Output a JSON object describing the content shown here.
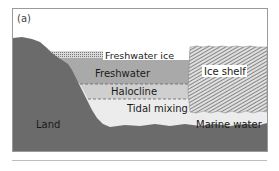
{
  "panel_label": "(a)",
  "labels": {
    "freshwater_ice": "Freshwater ice",
    "freshwater": "Freshwater",
    "halocline": "Halocline",
    "ice_shelf": "Ice shelf",
    "tidal_mixing": "Tidal mixing",
    "land": "Land",
    "marine_water": "Marine water"
  },
  "colors": {
    "land": "#6b6b6b",
    "freshwater": "#a9a9a9",
    "halocline": "#cfcfcf",
    "marine_water": "#ececec",
    "ice_hatch_dark": "#555555",
    "frame": "#9a9a9a"
  }
}
